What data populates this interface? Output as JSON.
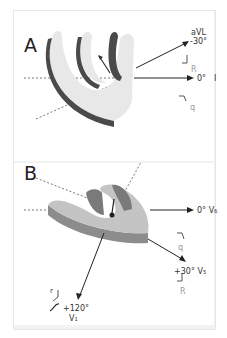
{
  "panels": [
    {
      "id": "A",
      "label": "A",
      "axes": [
        {
          "lead": "aVL",
          "angle": "-30°"
        },
        {
          "lead": "I",
          "angle": "0°"
        }
      ],
      "waveform_labels": {
        "upper": "R",
        "lower": "q"
      }
    },
    {
      "id": "B",
      "label": "B",
      "axes": [
        {
          "lead": "V6",
          "angle": "0°",
          "display": "0° V₆"
        },
        {
          "lead": "V5",
          "angle": "+30°",
          "display": "+30° V₅"
        },
        {
          "lead": "V1",
          "angle": "+120°",
          "display": "V₁"
        }
      ],
      "waveform_labels": {
        "q": "q",
        "R": "R",
        "r": "r"
      }
    }
  ],
  "colors": {
    "heart_light": "#e8e8e8",
    "heart_dark": "#4a4a4a",
    "heart_mid": "#8c8c8c",
    "axis": "#222222",
    "dashed": "#777777",
    "label_grey": "#9a9a9a"
  }
}
